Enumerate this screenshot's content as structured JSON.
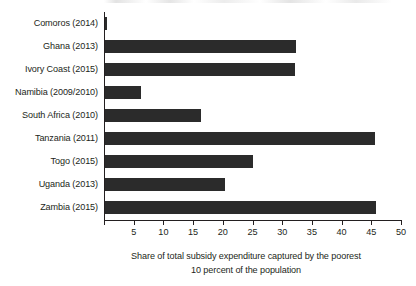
{
  "chart_data": {
    "type": "bar",
    "orientation": "horizontal",
    "title": "",
    "xlabel": "Share of total subsidy expenditure captured by the poorest 10 percent of the population",
    "xlabel_line1": "Share of total subsidy expenditure captured by the poorest",
    "xlabel_line2": "10 percent of the population",
    "ylabel": "",
    "xlim": [
      0,
      50
    ],
    "xticks": [
      5,
      10,
      15,
      20,
      25,
      30,
      35,
      40,
      45,
      50
    ],
    "xtick_labels": [
      "5",
      "10",
      "15",
      "20",
      "25",
      "30",
      "35",
      "40",
      "45",
      "50"
    ],
    "grid": false,
    "legend": false,
    "bar_color": "#2b2b2b",
    "axis_color": "#231f20",
    "categories": [
      "Comoros (2014)",
      "Ghana (2013)",
      "Ivory Coast (2015)",
      "Namibia (2009/2010)",
      "South Africa (2010)",
      "Tanzania (2011)",
      "Togo (2015)",
      "Uganda (2013)",
      "Zambia (2015)"
    ],
    "values": [
      0.3,
      32.2,
      32.0,
      6.1,
      16.2,
      45.5,
      24.9,
      20.2,
      45.6
    ]
  }
}
